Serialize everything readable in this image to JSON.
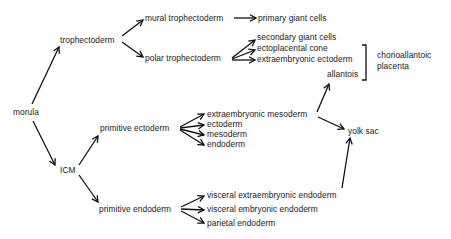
{
  "diagram": {
    "title": "",
    "nodes": {
      "morula": "morula",
      "trophectoderm": "trophectoderm",
      "mural_trophectoderm": "mural trophectoderm",
      "primary_giant_cells": "primary giant cells",
      "polar_trophectoderm": "polar trophectoderm",
      "secondary_giant_cells": "secondary giant cells",
      "ectoplacental_cone": "ectoplacental cone",
      "extraembryonic_ectoderm": "extraembryonic ectoderm",
      "allantois": "allantois",
      "chorioallantoic_line1": "chorioallantoic",
      "chorioallantoic_line2": "placenta",
      "icm": "ICM",
      "primitive_ectoderm": "primitive ectoderm",
      "extraembryonic_mesoderm": "extraembryonic mesoderm",
      "ectoderm": "ectoderm",
      "mesoderm": "mesoderm",
      "endoderm": "endoderm",
      "yolk_sac": "yolk sac",
      "primitive_endoderm": "primitive endoderm",
      "visceral_extraembryonic_endoderm": "visceral extraembryonic endoderm",
      "visceral_embryonic_endoderm": "visceral embryonic endoderm",
      "parietal_endoderm": "parietal endoderm"
    },
    "edges": [
      [
        "morula",
        "trophectoderm"
      ],
      [
        "morula",
        "ICM"
      ],
      [
        "trophectoderm",
        "mural trophectoderm"
      ],
      [
        "trophectoderm",
        "polar trophectoderm"
      ],
      [
        "mural trophectoderm",
        "primary giant cells"
      ],
      [
        "polar trophectoderm",
        "secondary giant cells"
      ],
      [
        "polar trophectoderm",
        "ectoplacental cone"
      ],
      [
        "polar trophectoderm",
        "extraembryonic ectoderm"
      ],
      [
        "ICM",
        "primitive ectoderm"
      ],
      [
        "ICM",
        "primitive endoderm"
      ],
      [
        "primitive ectoderm",
        "extraembryonic mesoderm"
      ],
      [
        "primitive ectoderm",
        "ectoderm"
      ],
      [
        "primitive ectoderm",
        "mesoderm"
      ],
      [
        "primitive ectoderm",
        "endoderm"
      ],
      [
        "extraembryonic mesoderm",
        "allantois"
      ],
      [
        "extraembryonic mesoderm",
        "yolk sac"
      ],
      [
        "primitive endoderm",
        "visceral extraembryonic endoderm"
      ],
      [
        "primitive endoderm",
        "visceral embryonic endoderm"
      ],
      [
        "primitive endoderm",
        "parietal endoderm"
      ],
      [
        "visceral extraembryonic endoderm",
        "yolk sac"
      ]
    ],
    "bracket": {
      "spans": [
        "extraembryonic ectoderm",
        "allantois"
      ],
      "label": "chorioallantoic placenta"
    },
    "colors": {
      "text": "#1a1a1a",
      "arrows": "#111111",
      "background": "#ffffff"
    }
  }
}
